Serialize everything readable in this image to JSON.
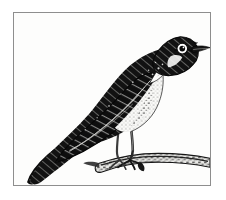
{
  "artwork": {
    "kind": "engraving-illustration",
    "subject": "perched songbird",
    "title": "",
    "caption": "",
    "technique": "wood-engraving halftone",
    "orientation": "facing right",
    "background_color": "#fdfdfc",
    "ink_color": "#111111",
    "frame_color": "#8e8e8e",
    "page_color": "#ffffff"
  },
  "frame": {
    "label": "illustration plate border",
    "x": 13,
    "y": 12,
    "width": 198,
    "height": 174,
    "border_width": 1
  },
  "parts": [
    {
      "id": "head",
      "label": "head"
    },
    {
      "id": "crown",
      "label": "crown"
    },
    {
      "id": "eye",
      "label": "eye"
    },
    {
      "id": "eye-ring",
      "label": "eye ring"
    },
    {
      "id": "beak",
      "label": "beak"
    },
    {
      "id": "throat",
      "label": "throat"
    },
    {
      "id": "breast",
      "label": "breast"
    },
    {
      "id": "back",
      "label": "back"
    },
    {
      "id": "wing",
      "label": "wing"
    },
    {
      "id": "tail",
      "label": "tail"
    },
    {
      "id": "legs",
      "label": "legs"
    },
    {
      "id": "feet",
      "label": "feet"
    },
    {
      "id": "branch",
      "label": "perch branch"
    }
  ],
  "palette": {
    "black": "#101010",
    "soft_black": "#1c1c1c",
    "mid_gray": "#6a6a6a",
    "light_gray": "#b8b8b8",
    "paper": "#fdfdfc",
    "white": "#ffffff"
  }
}
